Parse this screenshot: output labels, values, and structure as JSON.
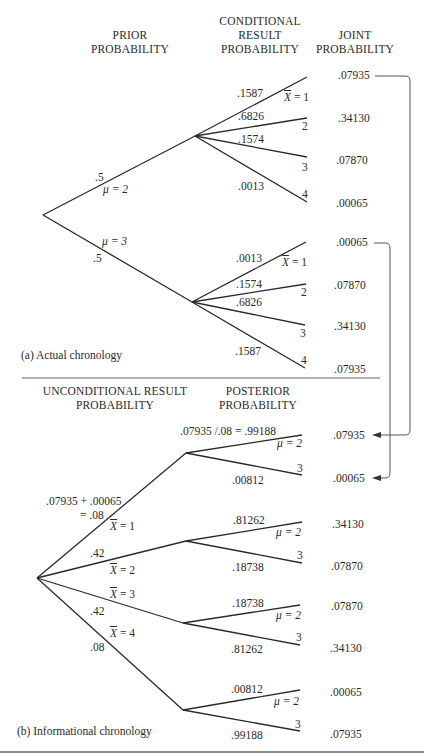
{
  "part_a": {
    "caption": "(a) Actual chronology",
    "headers": {
      "prior": [
        "PRIOR",
        "PROBABILITY"
      ],
      "conditional": [
        "CONDITIONAL",
        "RESULT",
        "PROBABILITY"
      ],
      "joint": [
        "JOINT",
        "PROBABILITY"
      ]
    },
    "branches": [
      {
        "prior": ".5",
        "mu_label": "μ = 2",
        "results": [
          {
            "cond": ".1587",
            "xbar_label": "X",
            "xbar_eq": " = 1",
            "joint": ".07935"
          },
          {
            "cond": ".6826",
            "x_label": "2",
            "joint": ".34130"
          },
          {
            "cond": ".1574",
            "x_label": "3",
            "joint": ".07870"
          },
          {
            "cond": ".0013",
            "x_label": "4",
            "joint": ".00065"
          }
        ]
      },
      {
        "prior": ".5",
        "mu_label": "μ = 3",
        "results": [
          {
            "cond": ".0013",
            "xbar_label": "X",
            "xbar_eq": " = 1",
            "joint": ".00065"
          },
          {
            "cond": ".1574",
            "x_label": "2",
            "joint": ".07870"
          },
          {
            "cond": ".6826",
            "x_label": "3",
            "joint": ".34130"
          },
          {
            "cond": ".1587",
            "x_label": "4",
            "joint": ".07935"
          }
        ]
      }
    ]
  },
  "part_b": {
    "caption": "(b) Informational chronology",
    "headers": {
      "unconditional": [
        "UNCONDITIONAL RESULT",
        "PROBABILITY"
      ],
      "posterior": [
        "POSTERIOR",
        "PROBABILITY"
      ]
    },
    "branches": [
      {
        "uncond_line1": ".07935 + .00065",
        "uncond_line2": "= .08",
        "x_label": "X",
        "x_eq": " = 1",
        "posteriors": [
          {
            "value": ".07935 /.08 = .99188",
            "mu_label": "μ = 2",
            "joint": ".07935"
          },
          {
            "value": ".00812",
            "mu_label": "3",
            "joint": ".00065"
          }
        ]
      },
      {
        "uncond": ".42",
        "x_label": "X",
        "x_eq": " = 2",
        "posteriors": [
          {
            "value": ".81262",
            "mu_label": "μ = 2",
            "joint": ".34130"
          },
          {
            "value": ".18738",
            "mu_label": "3",
            "joint": ".07870"
          }
        ]
      },
      {
        "uncond": ".42",
        "x_label": "X",
        "x_eq": " = 3",
        "posteriors": [
          {
            "value": ".18738",
            "mu_label": "μ = 2",
            "joint": ".07870"
          },
          {
            "value": ".81262",
            "mu_label": "3",
            "joint": ".34130"
          }
        ]
      },
      {
        "uncond": ".08",
        "x_label": "X",
        "x_eq": " = 4",
        "posteriors": [
          {
            "value": ".00812",
            "mu_label": "μ = 2",
            "joint": ".00065"
          },
          {
            "value": ".99188",
            "mu_label": "3",
            "joint": ".07935"
          }
        ]
      }
    ]
  },
  "colors": {
    "ink": "#2a2a2a",
    "rule": "#555555",
    "background": "#ffffff"
  }
}
